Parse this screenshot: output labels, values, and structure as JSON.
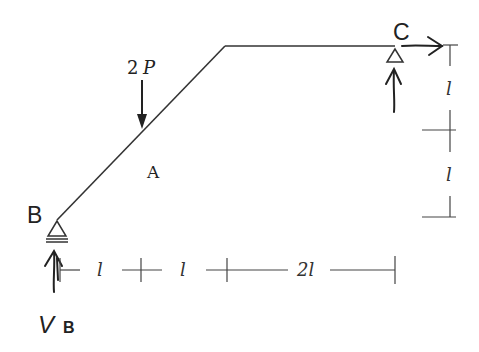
{
  "diagram": {
    "type": "structural frame",
    "colors": {
      "line": "#222222",
      "background": "#ffffff"
    },
    "nodes": {
      "B": {
        "label": "B",
        "support": "pin",
        "reaction_label_main": "V",
        "reaction_label_sub": "B"
      },
      "A": {
        "label": "A"
      },
      "C": {
        "label": "C",
        "support": "roller"
      }
    },
    "loads": {
      "point_load": {
        "magnitude_coef": "2",
        "symbol": "P",
        "direction": "down",
        "at": "A"
      }
    },
    "dimensions": {
      "horizontal": [
        {
          "label": "l"
        },
        {
          "label": "l"
        },
        {
          "label": "2l"
        }
      ],
      "vertical": [
        {
          "label": "l"
        },
        {
          "label": "l"
        }
      ]
    }
  }
}
